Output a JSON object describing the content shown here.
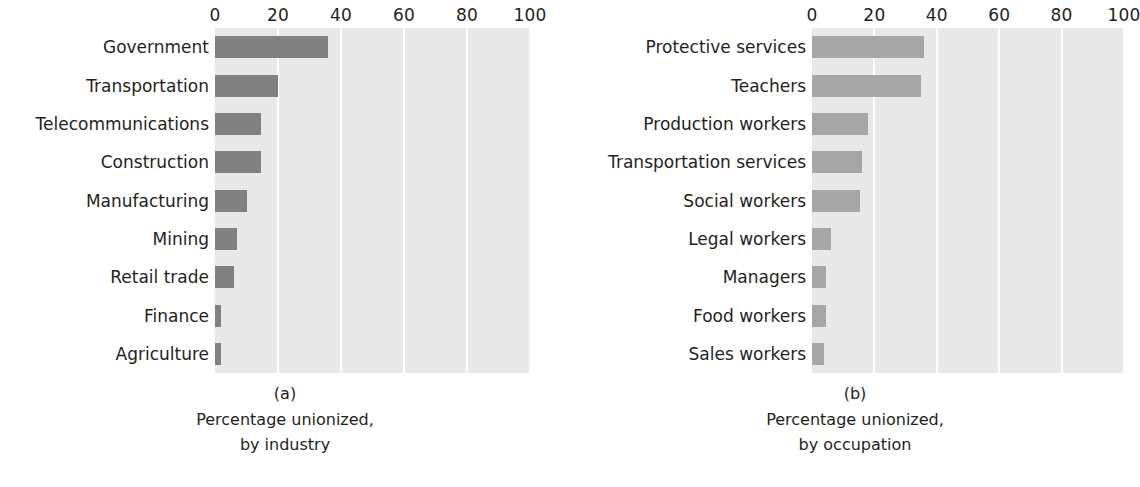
{
  "chart_data": [
    {
      "type": "bar",
      "orientation": "horizontal",
      "panel_label": "(a)",
      "title": "",
      "caption_lines": [
        "Percentage unionized,",
        "by industry"
      ],
      "xlabel": "",
      "ylabel": "",
      "xlim": [
        0,
        100
      ],
      "xticks": [
        0,
        20,
        40,
        60,
        80,
        100
      ],
      "xticklabels": [
        "0",
        "20",
        "40",
        "60",
        "80",
        "100"
      ],
      "grid": "vertical-white-gridlines",
      "legend": "none",
      "bar_color": "#808080",
      "plot_background": "#e8e8e8",
      "categories": [
        "Government",
        "Transportation",
        "Telecommunications",
        "Construction",
        "Manufacturing",
        "Mining",
        "Retail trade",
        "Finance",
        "Agriculture"
      ],
      "values": [
        36,
        20,
        14.5,
        14.5,
        10,
        7,
        6,
        2,
        2
      ]
    },
    {
      "type": "bar",
      "orientation": "horizontal",
      "panel_label": "(b)",
      "title": "",
      "caption_lines": [
        "Percentage unionized,",
        "by occupation"
      ],
      "xlabel": "",
      "ylabel": "",
      "xlim": [
        0,
        100
      ],
      "xticks": [
        0,
        20,
        40,
        60,
        80,
        100
      ],
      "xticklabels": [
        "0",
        "20",
        "40",
        "60",
        "80",
        "100"
      ],
      "grid": "vertical-white-gridlines",
      "legend": "none",
      "bar_color": "#a6a6a6",
      "plot_background": "#e8e8e8",
      "categories": [
        "Protective services",
        "Teachers",
        "Production workers",
        "Transportation services",
        "Social workers",
        "Legal workers",
        "Managers",
        "Food workers",
        "Sales workers"
      ],
      "values": [
        36,
        35,
        18,
        16,
        15.5,
        6,
        4.5,
        4.5,
        4
      ]
    }
  ]
}
